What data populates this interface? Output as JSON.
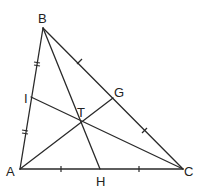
{
  "figure": {
    "type": "triangle-cevians",
    "points": {
      "A": {
        "x": 20,
        "y": 169
      },
      "B": {
        "x": 43,
        "y": 28
      },
      "C": {
        "x": 183,
        "y": 169
      },
      "H": {
        "x": 100,
        "y": 169
      },
      "G": {
        "x": 113,
        "y": 98
      },
      "I": {
        "x": 31,
        "y": 97
      },
      "T": {
        "x": 82,
        "y": 121
      }
    },
    "labels": {
      "A": "A",
      "B": "B",
      "C": "C",
      "H": "H",
      "G": "G",
      "I": "I",
      "T": "T"
    },
    "segments": [
      {
        "name": "side-AB",
        "from": "A",
        "to": "B"
      },
      {
        "name": "side-BC",
        "from": "B",
        "to": "C"
      },
      {
        "name": "side-AC",
        "from": "A",
        "to": "C"
      },
      {
        "name": "cevian-BH",
        "from": "B",
        "to": "H"
      },
      {
        "name": "cevian-AG",
        "from": "A",
        "to": "G"
      },
      {
        "name": "cevian-CI",
        "from": "C",
        "to": "I"
      }
    ],
    "tick_marks": [
      {
        "segment": "BI",
        "style": "double"
      },
      {
        "segment": "IA",
        "style": "double"
      },
      {
        "segment": "AH",
        "style": "single"
      },
      {
        "segment": "HC",
        "style": "single"
      },
      {
        "segment": "BG",
        "style": "single"
      },
      {
        "segment": "GC",
        "style": "single"
      }
    ],
    "stroke_color": "#2a2a2a",
    "background": "#ffffff"
  }
}
